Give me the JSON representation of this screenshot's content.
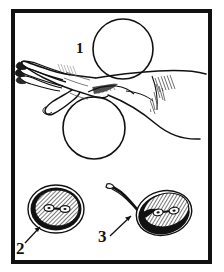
{
  "figure": {
    "style": "black-and-white pen-and-ink line drawing",
    "background_color": "#ffffff",
    "ink_color": "#111111",
    "frame": {
      "name": "outer-rectangular-border",
      "color": "#111111",
      "thickness_px": 4,
      "x": 11,
      "y": 9,
      "width": 201,
      "height": 255
    },
    "callouts": [
      {
        "id": "1",
        "label": "1",
        "target": "upper-sphere",
        "has_leader_line": false,
        "x": 76,
        "y": 41
      },
      {
        "id": "2",
        "label": "2",
        "target": "cross-section-detail-left",
        "has_leader_line": true,
        "leader_style": "arrow pointing up-right",
        "x": 16,
        "y": 240
      },
      {
        "id": "3",
        "label": "3",
        "target": "cross-section-detail-right",
        "has_leader_line": true,
        "leader_style": "arrow pointing up-right",
        "x": 98,
        "y": 228
      }
    ],
    "main_illustration": {
      "name": "hand-and-spheres-illustration",
      "elements": [
        {
          "name": "upper-sphere",
          "shape": "circle",
          "fill": "none",
          "stroke": "#111111",
          "cx": 123,
          "cy": 49,
          "r": 30
        },
        {
          "name": "lower-sphere",
          "shape": "circle",
          "fill": "none",
          "stroke": "#111111",
          "cx": 94,
          "cy": 128,
          "r": 31
        },
        {
          "name": "hand-with-extended-fingers",
          "description": "left-pointing hand, four fingers extended, thumb curling below, palm resting between the two spheres"
        },
        {
          "name": "forearm",
          "description": "forearm extending to the right edge, bending at elbow with cross-hatch shading in the antecubital crease"
        },
        {
          "name": "wrist-shading",
          "description": "short hatch strokes indicating shadow where the palm contacts the lower sphere"
        }
      ]
    },
    "detail_insets": [
      {
        "name": "cross-section-detail-left",
        "callout": "2",
        "description": "round cross-section: outer thin outline, thick solid black capsule ring, diagonally hatched interior, small dumbbell-shaped structure at centre",
        "cx": 56,
        "cy": 209,
        "rx": 28,
        "ry": 24,
        "features": {
          "outer_outline": "thin",
          "capsule_ring": "solid black, thick",
          "interior_fill": "diagonal hatching",
          "central_structure": "two small ovals joined by a short bar (dumbbell)"
        }
      },
      {
        "name": "cross-section-detail-right",
        "callout": "3",
        "description": "tilted oval cross-section with a long curved tail/duct sweeping up-left; thick black ring along lower edge, diagonally hatched interior, dumbbell-shaped structure at centre",
        "cx": 163,
        "cy": 213,
        "rx": 28,
        "ry": 22,
        "rotation_deg": -16,
        "features": {
          "tail": "long slender curved duct extending up and to the left",
          "capsule_ring": "solid black along the lower-left margin",
          "interior_fill": "diagonal hatching",
          "central_structure": "two small ovals joined by a short bar (dumbbell)"
        }
      }
    ]
  }
}
